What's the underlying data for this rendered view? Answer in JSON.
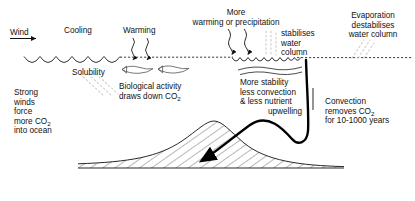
{
  "diagram": {
    "colors": {
      "ink": "#111111",
      "faint": "#c9c9c9",
      "thick": "#000000",
      "background": "#ffffff"
    }
  },
  "labels": {
    "wind": "Wind",
    "cooling": "Cooling",
    "warming": "Warming",
    "solubility": "Solubility",
    "strong_winds": "Strong\nwinds\nforce\nmore CO",
    "strong_winds_sub": "2",
    "strong_winds_tail": "\ninto ocean",
    "biological_line1": "Biological activity",
    "biological_line2_pre": "draws down CO",
    "biological_line2_sub": "2",
    "more_warming_line1": "More",
    "more_warming_line2": "warming or precipitation",
    "stabilises_line1": "stabilises",
    "stabilises_line2": "water",
    "stabilises_line3": "column",
    "evaporation_line1": "Evaporation",
    "evaporation_line2": "destabilises",
    "evaporation_line3": "water column",
    "more_stability_line1": "More stability",
    "more_stability_line2": "less convection",
    "more_stability_line3": "& less nutrient",
    "more_stability_line4": "upwelling",
    "convection_line1": "Convection",
    "convection_line2_pre": "removes CO",
    "convection_line2_sub": "2",
    "convection_line3": "for 10-1000 years"
  },
  "icons": {
    "wind_arrow": "arrow-right-icon",
    "warming_arrows": "wavy-down-arrow-icon",
    "precipitation_arrows": "wavy-down-arrow-icon",
    "fish": "fish-icon",
    "convection_arrow": "curved-down-left-arrow-icon",
    "solubility_streaks": "diagonal-dotted-lines-icon",
    "stabilises_streaks": "vertical-dotted-lines-icon",
    "evaporation_streaks": "diagonal-dotted-lines-icon",
    "seafloor": "hatched-seamount-icon",
    "sea_surface": "wave-line-icon",
    "subsurface_waves": "wavy-line-icon"
  }
}
